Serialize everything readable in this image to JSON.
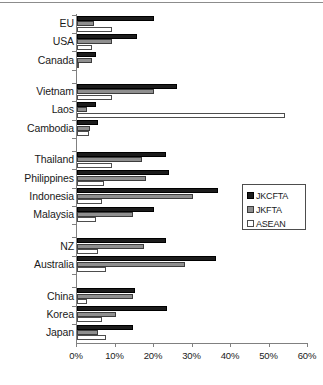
{
  "chart_data": {
    "type": "bar",
    "orientation": "horizontal",
    "title": "",
    "xlabel": "",
    "ylabel": "",
    "xlim": [
      0,
      60
    ],
    "xunit": "%",
    "xticks": [
      "0%",
      "10%",
      "20%",
      "30%",
      "40%",
      "50%",
      "60%"
    ],
    "xtick_values": [
      0,
      10,
      20,
      30,
      40,
      50,
      60
    ],
    "grid": false,
    "legend_position": "right-middle",
    "legend": [
      "JKCFTA",
      "JKFTA",
      "ASEAN"
    ],
    "series": [
      {
        "name": "JKCFTA",
        "color": "#1c1c1c",
        "values": [
          20.0,
          15.5,
          5.0,
          26.0,
          5.0,
          5.5,
          23.0,
          24.0,
          36.5,
          20.0,
          23.0,
          36.0,
          15.0,
          23.5,
          14.5
        ]
      },
      {
        "name": "JKFTA",
        "color": "#8f8f8f",
        "values": [
          4.5,
          9.0,
          4.0,
          20.0,
          2.5,
          3.5,
          17.0,
          18.0,
          30.0,
          14.5,
          17.5,
          28.0,
          14.5,
          10.0,
          5.5
        ]
      },
      {
        "name": "ASEAN",
        "color": "#ffffff",
        "values": [
          9.0,
          4.0,
          0.5,
          9.0,
          54.0,
          3.0,
          9.0,
          7.0,
          6.5,
          5.0,
          5.5,
          7.5,
          2.5,
          6.5,
          7.5
        ]
      }
    ],
    "categories": [
      "EU",
      "USA",
      "Canada",
      "Vietnam",
      "Laos",
      "Cambodia",
      "Thailand",
      "Philippines",
      "Indonesia",
      "Malaysia",
      "NZ",
      "Australia",
      "China",
      "Korea",
      "Japan"
    ],
    "category_groups": [
      [
        "EU",
        "USA",
        "Canada"
      ],
      [
        "Vietnam",
        "Laos",
        "Cambodia"
      ],
      [
        "Thailand",
        "Philippines",
        "Indonesia",
        "Malaysia"
      ],
      [
        "NZ",
        "Australia"
      ],
      [
        "China",
        "Korea",
        "Japan"
      ]
    ]
  }
}
